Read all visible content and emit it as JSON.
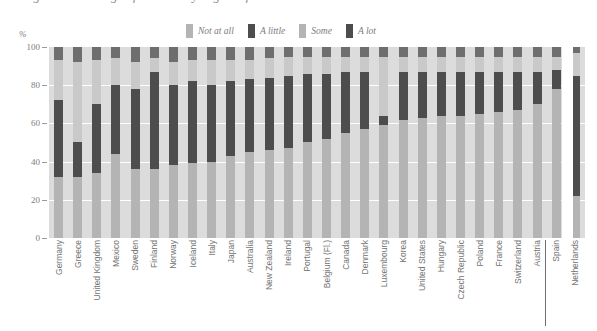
{
  "title": "Figure: Percentage of students by degree of",
  "axis": {
    "y_unit": "%",
    "y_ticks": [
      100,
      80,
      60,
      40,
      20,
      0
    ],
    "ylim": [
      0,
      100
    ]
  },
  "legend": {
    "position": "top",
    "items": [
      {
        "label": "Not at all",
        "color": "#b4b4b4"
      },
      {
        "label": "A little",
        "color": "#4d4d4d"
      },
      {
        "label": "Some",
        "color": "#b4b4b4"
      },
      {
        "label": "A lot",
        "color": "#4d4d4d"
      }
    ]
  },
  "colors": {
    "not_at_all": "#b4b4b4",
    "a_little": "#4d4d4d",
    "some": "#c9c9c9",
    "a_lot": "#6e6e6e",
    "panel": "#dcdcdc",
    "gridline": "#ffffff",
    "text": "#737373",
    "separator": "#6f6f6f"
  },
  "separator_note": "Netherlands shown separately to the right of a vertical rule",
  "chart_data": {
    "type": "bar",
    "stacked": true,
    "orientation": "vertical",
    "title": "Figure: Percentage of students by degree of",
    "xlabel": "",
    "ylabel": "%",
    "ylim": [
      0,
      100
    ],
    "yticks": [
      0,
      20,
      40,
      60,
      80,
      100
    ],
    "grid": true,
    "legend_position": "top",
    "categories": [
      "Germany",
      "Greece",
      "United Kingdom",
      "Mexico",
      "Sweden",
      "Finland",
      "Norway",
      "Iceland",
      "Italy",
      "Japan",
      "Australia",
      "New Zealand",
      "Ireland",
      "Portugal",
      "Belgium (Fl.)",
      "Canada",
      "Denmark",
      "Luxembourg",
      "Korea",
      "United States",
      "Hungary",
      "Czech Republic",
      "Poland",
      "France",
      "Switzerland",
      "Austria",
      "Spain",
      "Netherlands"
    ],
    "series": [
      {
        "name": "Not at all",
        "color": "#b4b4b4",
        "values": [
          32,
          32,
          34,
          44,
          36,
          36,
          38,
          39,
          40,
          43,
          45,
          46,
          47,
          50,
          52,
          55,
          57,
          59,
          62,
          63,
          64,
          64,
          65,
          66,
          67,
          70,
          78,
          22
        ]
      },
      {
        "name": "A little",
        "color": "#4d4d4d",
        "values": [
          40,
          18,
          36,
          36,
          42,
          51,
          42,
          43,
          40,
          39,
          38,
          38,
          38,
          36,
          34,
          32,
          30,
          5,
          25,
          24,
          23,
          23,
          22,
          21,
          20,
          17,
          10,
          63
        ]
      },
      {
        "name": "Some",
        "color": "#c9c9c9",
        "values": [
          21,
          42,
          23,
          14,
          14,
          7,
          12,
          11,
          13,
          11,
          10,
          10,
          10,
          9,
          9,
          8,
          8,
          31,
          8,
          8,
          8,
          8,
          8,
          8,
          8,
          8,
          7,
          12
        ]
      },
      {
        "name": "A lot",
        "color": "#6e6e6e",
        "values": [
          7,
          8,
          7,
          6,
          8,
          6,
          8,
          7,
          7,
          7,
          7,
          6,
          5,
          5,
          5,
          5,
          5,
          5,
          5,
          5,
          5,
          5,
          5,
          5,
          5,
          5,
          5,
          3
        ]
      }
    ]
  }
}
